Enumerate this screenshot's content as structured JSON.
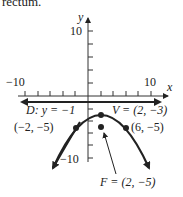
{
  "header_fragment": "rectum.",
  "graph": {
    "x_axis_label": "x",
    "y_axis_label": "y",
    "tick_labels": {
      "x_min": "−10",
      "x_max": "10",
      "y_max": "10",
      "y_min": "−10"
    },
    "directrix_label_prefix": "D:",
    "directrix_label_eq": "y = −1",
    "vertex_label": "V = (2, −3)",
    "left_point_label": "(−2, −5)",
    "right_point_label": "(6, −5)",
    "focus_label": "F = (2, −5)"
  },
  "diagram_data": {
    "type": "parabola",
    "opens": "down",
    "vertex": [
      2,
      -3
    ],
    "focus": [
      2,
      -5
    ],
    "directrix": "y = -1",
    "latus_rectum_endpoints": [
      [
        -2,
        -5
      ],
      [
        6,
        -5
      ]
    ],
    "axis_range": {
      "x": [
        -10,
        10
      ],
      "y": [
        -10,
        10
      ]
    }
  }
}
